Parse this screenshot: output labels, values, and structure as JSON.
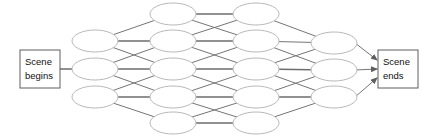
{
  "diagram": {
    "background_color": "#ffffff",
    "node_fill": "#ffffff",
    "node_stroke": "#b9b9b9",
    "edge_color": "#757575",
    "terminal_stroke": "#5e5e5e",
    "terminal_text_color": "#111111",
    "start_terminal": {
      "line1": "Scene",
      "line2": "begins",
      "x": 20,
      "y": 50,
      "width": 40,
      "height": 38
    },
    "end_terminal": {
      "line1": "Scene",
      "line2": "ends",
      "x": 378,
      "y": 50,
      "width": 40,
      "height": 38
    },
    "columns": [
      {
        "index": 0,
        "count": 3,
        "cx": 95,
        "rx": 23,
        "ry": 11,
        "cy": [
          41,
          69,
          97
        ]
      },
      {
        "index": 1,
        "count": 5,
        "cx": 173,
        "rx": 23,
        "ry": 11,
        "cy": [
          14,
          41,
          69,
          97,
          123
        ]
      },
      {
        "index": 2,
        "count": 5,
        "cx": 256,
        "rx": 23,
        "ry": 11,
        "cy": [
          14,
          41,
          69,
          97,
          123
        ]
      },
      {
        "index": 3,
        "count": 3,
        "cx": 334,
        "rx": 23,
        "ry": 11,
        "cy": [
          43,
          70,
          97
        ]
      }
    ],
    "edges_col0_col1": [
      [
        0,
        0
      ],
      [
        0,
        1
      ],
      [
        1,
        1
      ],
      [
        1,
        2
      ],
      [
        1,
        3
      ],
      [
        2,
        3
      ],
      [
        2,
        4
      ],
      [
        0,
        2
      ],
      [
        2,
        2
      ]
    ],
    "edges_col1_col2": [
      [
        0,
        0
      ],
      [
        0,
        1
      ],
      [
        1,
        0
      ],
      [
        1,
        1
      ],
      [
        1,
        2
      ],
      [
        2,
        1
      ],
      [
        2,
        2
      ],
      [
        2,
        3
      ],
      [
        3,
        2
      ],
      [
        3,
        3
      ],
      [
        3,
        4
      ],
      [
        4,
        3
      ],
      [
        4,
        4
      ]
    ],
    "edges_col2_col3": [
      [
        0,
        0
      ],
      [
        1,
        0
      ],
      [
        1,
        1
      ],
      [
        2,
        0
      ],
      [
        2,
        1
      ],
      [
        2,
        2
      ],
      [
        3,
        1
      ],
      [
        3,
        2
      ],
      [
        4,
        2
      ]
    ],
    "start_link": {
      "from_x": 60,
      "from_y": 69,
      "to_x": 72,
      "to_y": 69
    },
    "end_links": [
      {
        "from_col": 3,
        "from_index": 0,
        "to_x": 377,
        "to_y": 60
      },
      {
        "from_col": 3,
        "from_index": 1,
        "to_x": 377,
        "to_y": 69
      },
      {
        "from_col": 3,
        "from_index": 2,
        "to_x": 377,
        "to_y": 78
      }
    ]
  }
}
